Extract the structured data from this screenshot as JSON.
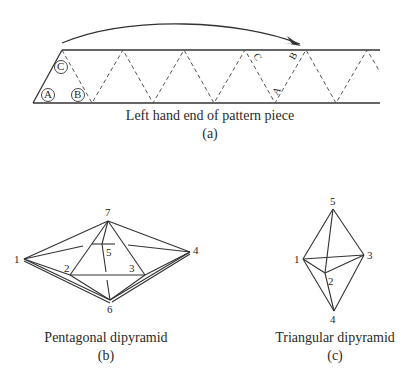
{
  "figure_a": {
    "caption": "Left hand end of pattern piece",
    "sublabel": "(a)",
    "circled_labels": [
      "A",
      "B",
      "C"
    ],
    "edge_labels": [
      "C",
      "B",
      "A"
    ]
  },
  "figure_b": {
    "caption": "Pentagonal dipyramid",
    "sublabel": "(b)",
    "vertex_labels": {
      "v1": "1",
      "v2": "2",
      "v3": "3",
      "v4": "4",
      "v5": "5",
      "v6": "6",
      "v7": "7"
    }
  },
  "figure_c": {
    "caption": "Triangular dipyramid",
    "sublabel": "(c)",
    "vertex_labels": {
      "v1": "1",
      "v2": "2",
      "v3": "3",
      "v4": "4",
      "v5": "5"
    }
  },
  "colors": {
    "line": "#333333",
    "text": "#2a2a2a"
  }
}
